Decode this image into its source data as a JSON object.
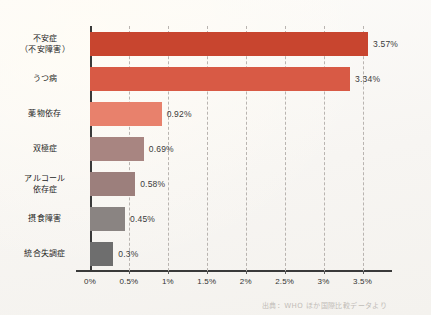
{
  "chart_data": {
    "type": "bar",
    "orientation": "horizontal",
    "title": "",
    "xlabel": "",
    "ylabel": "",
    "xlim": [
      0,
      3.75
    ],
    "grid": true,
    "legend": "none",
    "categories": [
      "不安症（不安障害）",
      "うつ病",
      "薬物依存",
      "双極症",
      "アルコール依存症",
      "摂食障害",
      "統合失調症"
    ],
    "values": [
      3.57,
      3.34,
      0.92,
      0.69,
      0.58,
      0.45,
      0.3
    ],
    "value_labels": [
      "3.57%",
      "3.34%",
      "0.92%",
      "0.69%",
      "0.58%",
      "0.45%",
      "0.3%"
    ],
    "bar_colors": [
      "#c8452f",
      "#d85a45",
      "#e8816c",
      "#a88581",
      "#9c7f7c",
      "#8a8482",
      "#6e6e6e"
    ],
    "xticks": [
      0,
      0.5,
      1,
      1.5,
      2,
      2.5,
      3,
      3.5
    ],
    "xtick_labels": [
      "0%",
      "0.5%",
      "1%",
      "1.5%",
      "2%",
      "2.5%",
      "3%",
      "3.5%"
    ]
  },
  "categories_lines": [
    [
      "不安症",
      "（不安障害）"
    ],
    [
      "うつ病"
    ],
    [
      "薬物依存"
    ],
    [
      "双極症"
    ],
    [
      "アルコール",
      "依存症"
    ],
    [
      "摂食障害"
    ],
    [
      "統合失調症"
    ]
  ],
  "source": {
    "note": "出典：WHO ほか国際比較データより"
  }
}
